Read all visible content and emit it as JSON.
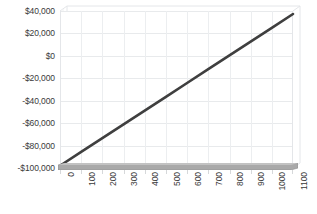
{
  "chart_data": {
    "type": "line",
    "title": "",
    "subtitle": "",
    "xlabel": "",
    "ylabel": "",
    "grid": true,
    "legend": false,
    "legend_position": "none",
    "style": "excel-3d-line",
    "series_color": "#3f3f3f",
    "gridline_color": "#e8eaec",
    "floor_color": "#9a9a9a",
    "text_color": "#3a3a3a",
    "background_color": "#ffffff",
    "xlim": [
      0,
      1100
    ],
    "ylim": [
      -100000,
      40000
    ],
    "y_tick_step": 20000,
    "x_tick_step": 100,
    "y_tick_labels": [
      "$40,000",
      "$20,000",
      "$0",
      "-$20,000",
      "-$40,000",
      "-$60,000",
      "-$80,000",
      "-$100,000"
    ],
    "y_tick_values": [
      40000,
      20000,
      0,
      -20000,
      -40000,
      -60000,
      -80000,
      -100000
    ],
    "x_tick_labels": [
      "0",
      "100",
      "200",
      "300",
      "400",
      "500",
      "600",
      "700",
      "800",
      "900",
      "1000",
      "1100"
    ],
    "x_tick_values": [
      0,
      100,
      200,
      300,
      400,
      500,
      600,
      700,
      800,
      900,
      1000,
      1100
    ],
    "series": [
      {
        "name": "Cumulative",
        "x": [
          0,
          100,
          200,
          300,
          400,
          500,
          600,
          700,
          800,
          900,
          1000,
          1100
        ],
        "values": [
          -98000,
          -85700,
          -73400,
          -61100,
          -48800,
          -36500,
          -24200,
          -11900,
          400,
          12700,
          25000,
          37300
        ]
      }
    ],
    "annotations": []
  }
}
